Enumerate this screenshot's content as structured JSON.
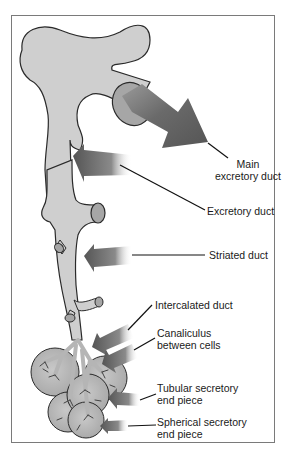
{
  "figure": {
    "type": "salivary gland duct system schematic",
    "colors": {
      "duct_fill": "#cfcfcf",
      "duct_outline": "#2a2a2a",
      "arrow_dark": "#5a5a5a",
      "frame": "#7a7a7a",
      "text": "#1a1a1a"
    }
  },
  "labels": {
    "main_excretory_duct_line1": "Main",
    "main_excretory_duct_line2": "excretory duct",
    "excretory_duct": "Excretory duct",
    "striated_duct": "Striated duct",
    "intercalated_duct": "Intercalated duct",
    "canaliculus_line1": "Canaliculus",
    "canaliculus_line2": "between cells",
    "tubular_line1": "Tubular secretory",
    "tubular_line2": "end piece",
    "spherical_line1": "Spherical secretory",
    "spherical_line2": "end piece"
  }
}
